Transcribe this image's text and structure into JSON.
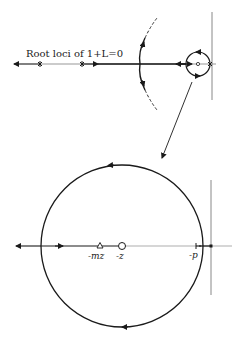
{
  "figure": {
    "title_label": "Root loci of 1+L=0",
    "top_plot": {
      "description": "Full root locus of 1+L=0 on the s-plane",
      "real_axis_y": 64,
      "imag_axis_x": 212,
      "small_circle": {
        "cx": 198,
        "cy": 64,
        "r": 12
      },
      "breakaway_marks_x": [
        40,
        82,
        210
      ],
      "arc": {
        "top": [
          157,
          18
        ],
        "apex": [
          140,
          64
        ],
        "bottom": [
          157,
          110
        ]
      }
    },
    "connector": {
      "from": [
        192,
        82
      ],
      "to": [
        162,
        160
      ],
      "meaning": "magnified view"
    },
    "bottom_plot": {
      "description": "Magnified view of locus near origin",
      "real_axis_y": 246,
      "imag_axis_x": 211,
      "big_circle": {
        "cx": 122,
        "cy": 246,
        "r": 81
      },
      "labels": {
        "mz": "-mz",
        "z": "-z",
        "p": "-p"
      },
      "markers": {
        "mz_triangle_x": 100,
        "z_open_circle_x": 122,
        "p_mark_x": 197,
        "origin_pole_x": 211
      }
    },
    "colors": {
      "line": "#1a1a1a",
      "axis": "#6b6b6b",
      "background": "#ffffff"
    }
  }
}
